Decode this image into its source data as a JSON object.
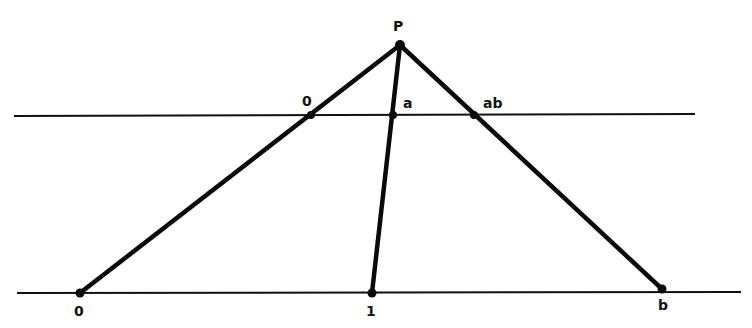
{
  "diagram": {
    "lines": {
      "top_parallel": {
        "x1": 14,
        "y1": 116,
        "x2": 695,
        "y2": 114
      },
      "bottom_parallel": {
        "x1": 17,
        "y1": 293,
        "x2": 741,
        "y2": 292
      }
    },
    "points": {
      "P": {
        "label": "P",
        "x": 400,
        "y": 45
      },
      "top_zero": {
        "label": "0",
        "x": 311,
        "y": 115
      },
      "a": {
        "label": "a",
        "x": 393,
        "y": 115
      },
      "ab": {
        "label": "ab",
        "x": 474,
        "y": 115
      },
      "bottom_zero": {
        "label": "0",
        "x": 80,
        "y": 293
      },
      "one": {
        "label": "1",
        "x": 372,
        "y": 293
      },
      "b": {
        "label": "b",
        "x": 662,
        "y": 289
      }
    },
    "rays": [
      {
        "from": "P",
        "to": "bottom_zero"
      },
      {
        "from": "P",
        "to": "one"
      },
      {
        "from": "P",
        "to": "b"
      }
    ],
    "labels": {
      "P": "P",
      "top_zero": "0",
      "a": "a",
      "ab": "ab",
      "bottom_zero": "0",
      "one": "1",
      "b": "b"
    }
  }
}
